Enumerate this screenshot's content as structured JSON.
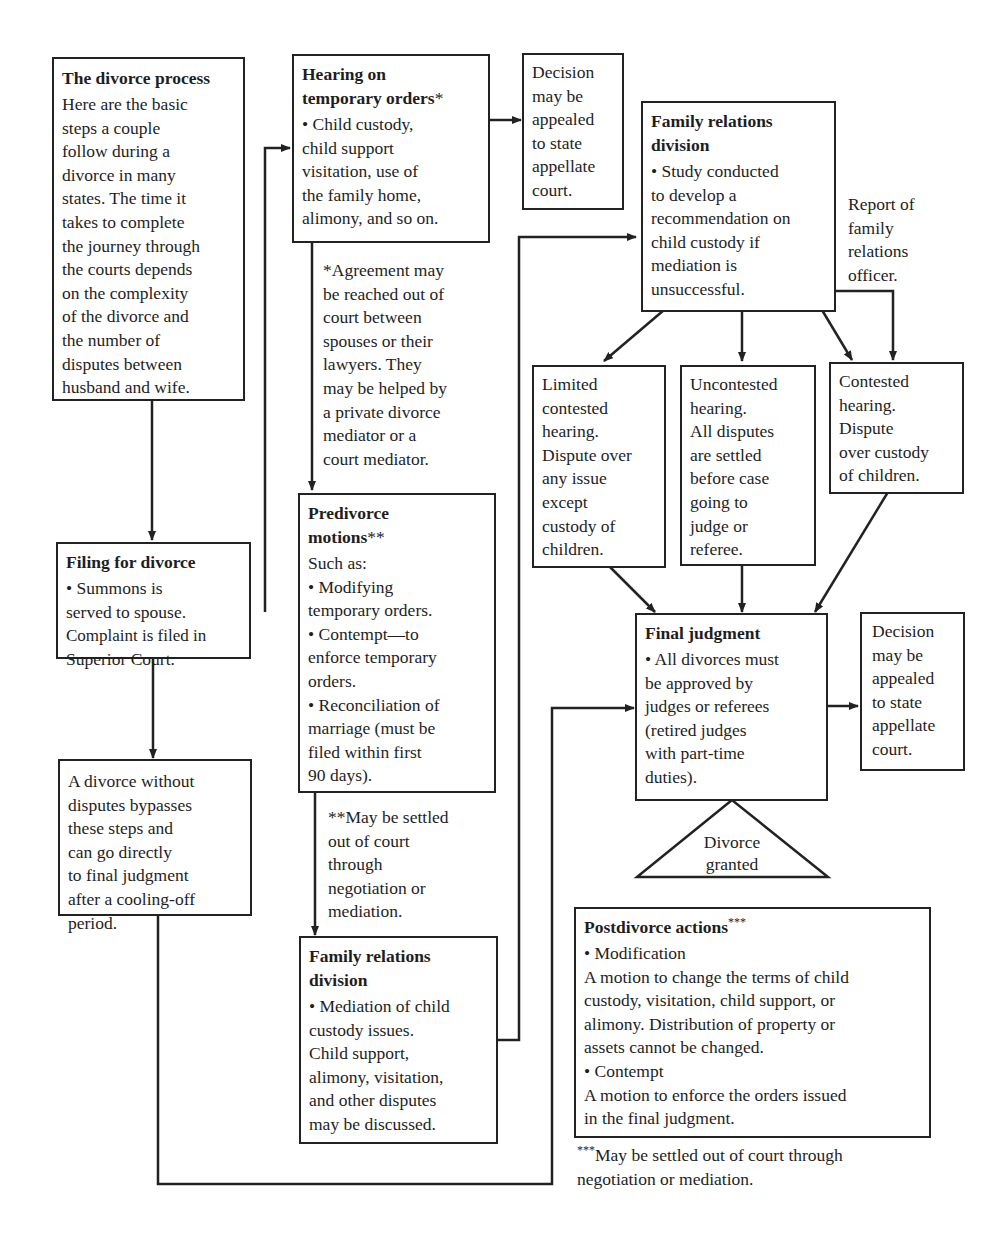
{
  "intro": {
    "title": "The divorce process",
    "lines": [
      "Here are the basic",
      "steps a couple",
      "follow during a",
      "divorce in many",
      "states. The time it",
      "takes to complete",
      "the journey through",
      "the courts depends",
      "on the complexity",
      "of the divorce and",
      "the number of",
      "disputes between",
      "husband and wife."
    ]
  },
  "filing": {
    "title": "Filing for divorce",
    "lines": [
      "• Summons is",
      "served to spouse.",
      "Complaint is filed in",
      "Superior Court."
    ]
  },
  "no_disputes": {
    "lines": [
      "A divorce without",
      "disputes bypasses",
      "these steps and",
      "can go directly",
      "to final judgment",
      "after a cooling-off",
      "period."
    ]
  },
  "hearing": {
    "title_lines": [
      "Hearing on",
      "temporary orders"
    ],
    "title_mark": "*",
    "lines": [
      "• Child custody,",
      "child support",
      "visitation, use of",
      "the family home,",
      "alimony, and so on."
    ]
  },
  "hearing_note": {
    "lines": [
      "*Agreement may",
      "be reached out of",
      "court between",
      "spouses or their",
      "lawyers. They",
      "may be helped by",
      "a private divorce",
      "mediator or a",
      "court mediator."
    ]
  },
  "appeal_top": {
    "lines": [
      "Decision",
      "may be",
      "appealed",
      "to state",
      "appellate",
      "court."
    ]
  },
  "predivorce": {
    "title_lines": [
      "Predivorce",
      "motions"
    ],
    "title_mark": "**",
    "lines": [
      "Such as:",
      "• Modifying",
      "temporary orders.",
      "• Contempt—to",
      "enforce temporary",
      "orders.",
      "• Reconciliation of",
      "marriage (must be",
      "filed within first",
      "90 days)."
    ]
  },
  "predivorce_note": {
    "lines": [
      "**May be settled",
      "out of court",
      "through",
      "negotiation or",
      "mediation."
    ]
  },
  "family_mediation": {
    "title_lines": [
      "Family relations",
      "division"
    ],
    "lines": [
      "• Mediation of child",
      "custody issues.",
      "Child support,",
      "alimony, visitation,",
      "and other disputes",
      "may be discussed."
    ]
  },
  "family_study": {
    "title_lines": [
      "Family relations",
      "division"
    ],
    "lines": [
      "• Study conducted",
      "to develop a",
      "recommendation on",
      "child custody if",
      "mediation is",
      "unsuccessful."
    ]
  },
  "report_note": {
    "lines": [
      "Report of",
      "family",
      "relations",
      "officer."
    ]
  },
  "limited": {
    "lines": [
      "Limited",
      "contested",
      "hearing.",
      "Dispute over",
      "any issue",
      "except",
      "custody of",
      "children."
    ]
  },
  "uncontested": {
    "lines": [
      "Uncontested",
      "hearing.",
      "All disputes",
      "are settled",
      "before case",
      "going to",
      "judge or",
      "referee."
    ]
  },
  "contested": {
    "lines": [
      "Contested",
      "hearing.",
      "Dispute",
      "over custody",
      "of children."
    ]
  },
  "final": {
    "title": "Final judgment",
    "lines": [
      "• All divorces must",
      "be approved by",
      "judges or referees",
      "(retired judges",
      "with part-time",
      "duties)."
    ]
  },
  "appeal_final": {
    "lines": [
      "Decision",
      "may be",
      "appealed",
      "to state",
      "appellate",
      "court."
    ]
  },
  "granted": {
    "lines": [
      "Divorce",
      "granted"
    ]
  },
  "postdivorce": {
    "title": "Postdivorce actions",
    "title_mark": "***",
    "lines": [
      "• Modification",
      "A motion to change the terms of child",
      "custody, visitation, child support, or",
      "alimony. Distribution of property or",
      "assets cannot be changed.",
      "• Contempt",
      "A motion to enforce the orders issued",
      "in the final judgment."
    ]
  },
  "postdivorce_note": {
    "mark": "***",
    "lines": [
      "May be settled out of court through",
      "negotiation or mediation."
    ]
  }
}
